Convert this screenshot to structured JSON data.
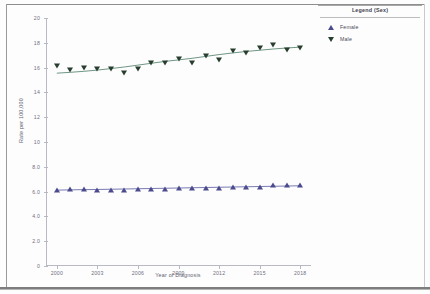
{
  "chart_data": {
    "type": "scatter",
    "title": "",
    "xlabel": "Year of Diagnosis",
    "ylabel": "Rate per 100,000",
    "xlim": [
      1999.2,
      2018.8
    ],
    "ylim": [
      0,
      20
    ],
    "grid": false,
    "x": [
      2000,
      2001,
      2002,
      2003,
      2004,
      2005,
      2006,
      2007,
      2008,
      2009,
      2010,
      2011,
      2012,
      2013,
      2014,
      2015,
      2016,
      2017,
      2018
    ],
    "xticks": [
      "2000",
      "2003",
      "2006",
      "2009",
      "2012",
      "2015",
      "2018"
    ],
    "xtick_values": [
      2000,
      2003,
      2006,
      2009,
      2012,
      2015,
      2018
    ],
    "yticks": [
      "0",
      "2.0",
      "4.0",
      "6.0",
      "8.0",
      "10",
      "12",
      "14",
      "16",
      "18",
      "20"
    ],
    "ytick_values": [
      0,
      2,
      4,
      6,
      8,
      10,
      12,
      14,
      16,
      18,
      20
    ],
    "series": [
      {
        "name": "Male",
        "marker": "triangle-down",
        "color": "#273d2e",
        "trend_color": "#6f9685",
        "values": [
          16.1,
          15.8,
          16.0,
          15.9,
          15.9,
          15.6,
          15.9,
          16.4,
          16.4,
          16.7,
          16.4,
          16.9,
          16.6,
          17.3,
          17.2,
          17.6,
          17.8,
          17.4,
          17.6
        ],
        "trend": [
          15.55,
          15.62,
          15.7,
          15.8,
          15.92,
          16.05,
          16.2,
          16.35,
          16.5,
          16.62,
          16.75,
          16.9,
          17.05,
          17.18,
          17.3,
          17.4,
          17.5,
          17.58,
          17.65
        ]
      },
      {
        "name": "Female",
        "marker": "triangle-up",
        "color": "#4a4a8c",
        "trend_color": "#7a7ab5",
        "values": [
          6.1,
          6.2,
          6.2,
          6.1,
          6.1,
          6.1,
          6.2,
          6.2,
          6.2,
          6.3,
          6.3,
          6.3,
          6.3,
          6.4,
          6.4,
          6.4,
          6.5,
          6.5,
          6.5
        ],
        "trend": [
          6.12,
          6.14,
          6.16,
          6.17,
          6.19,
          6.21,
          6.23,
          6.25,
          6.27,
          6.29,
          6.31,
          6.33,
          6.35,
          6.37,
          6.39,
          6.41,
          6.43,
          6.45,
          6.47
        ]
      }
    ]
  },
  "legend": {
    "title": "Legend (Sex)",
    "entries": [
      {
        "label": "Female",
        "marker": "triangle-up",
        "color": "#4a4a8c"
      },
      {
        "label": "Male",
        "marker": "triangle-down",
        "color": "#273d2e"
      }
    ]
  }
}
